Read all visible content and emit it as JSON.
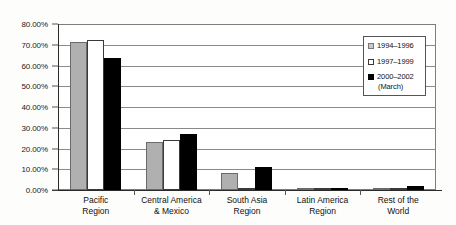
{
  "chart_data": {
    "type": "bar",
    "title": "",
    "subtitle": "",
    "xlabel": "",
    "ylabel": "",
    "ylim": [
      0,
      80
    ],
    "y_tick_labels": [
      "80.00%",
      "70.00%",
      "60.00%",
      "50.00%",
      "40.00%",
      "30.00%",
      "20.00%",
      "10.00%",
      "0.00%"
    ],
    "y_tick_values": [
      80,
      70,
      60,
      50,
      40,
      30,
      20,
      10,
      0
    ],
    "y_axis_format": "percent",
    "grid": "horizontal",
    "legend_position": "inside-top-right",
    "categories": [
      "Pacific Region",
      "Central America & Mexico",
      "South Asia Region",
      "Latin America Region",
      "Rest of the World"
    ],
    "category_label_lines": [
      [
        "Pacific",
        "Region"
      ],
      [
        "Central America",
        "& Mexico"
      ],
      [
        "South Asia",
        "Region"
      ],
      [
        "Latin America",
        "Region"
      ],
      [
        "Rest of the",
        "World"
      ]
    ],
    "series": [
      {
        "name": "1994-1996",
        "label_lines": [
          "1994–1996"
        ],
        "color": "#b0b0b0",
        "values": [
          71.5,
          23.2,
          8.0,
          0.3,
          0.8
        ]
      },
      {
        "name": "1997-1999",
        "label_lines": [
          "1997–1999"
        ],
        "color": "#ffffff",
        "values": [
          72.5,
          24.2,
          0.0,
          0.0,
          0.0
        ]
      },
      {
        "name": "2000-2002 (March)",
        "label_lines": [
          "2000–2002",
          "(March)"
        ],
        "color": "#000000",
        "values": [
          63.5,
          27.0,
          11.0,
          0.3,
          1.8
        ]
      }
    ]
  }
}
